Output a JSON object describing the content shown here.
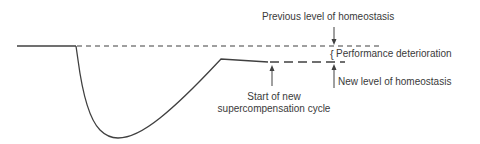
{
  "diagram": {
    "colors": {
      "line": "#404040",
      "text": "#3a3a3a",
      "background": "#ffffff"
    },
    "labels": {
      "previous_level": "Previous level of homeostasis",
      "performance_deterioration": "Performance deterioration",
      "new_level": "New level of homeostasis",
      "start_new_cycle_line1": "Start of new",
      "start_new_cycle_line2": "supercompensation cycle"
    },
    "elements": {
      "baseline": "solid line at previous homeostasis level",
      "previous_level_line": "dashed line",
      "new_level_line": "dashed line (lower)",
      "curve": "performance curve: drop, recovery, plateau below baseline",
      "brace_glyph": "{"
    }
  }
}
